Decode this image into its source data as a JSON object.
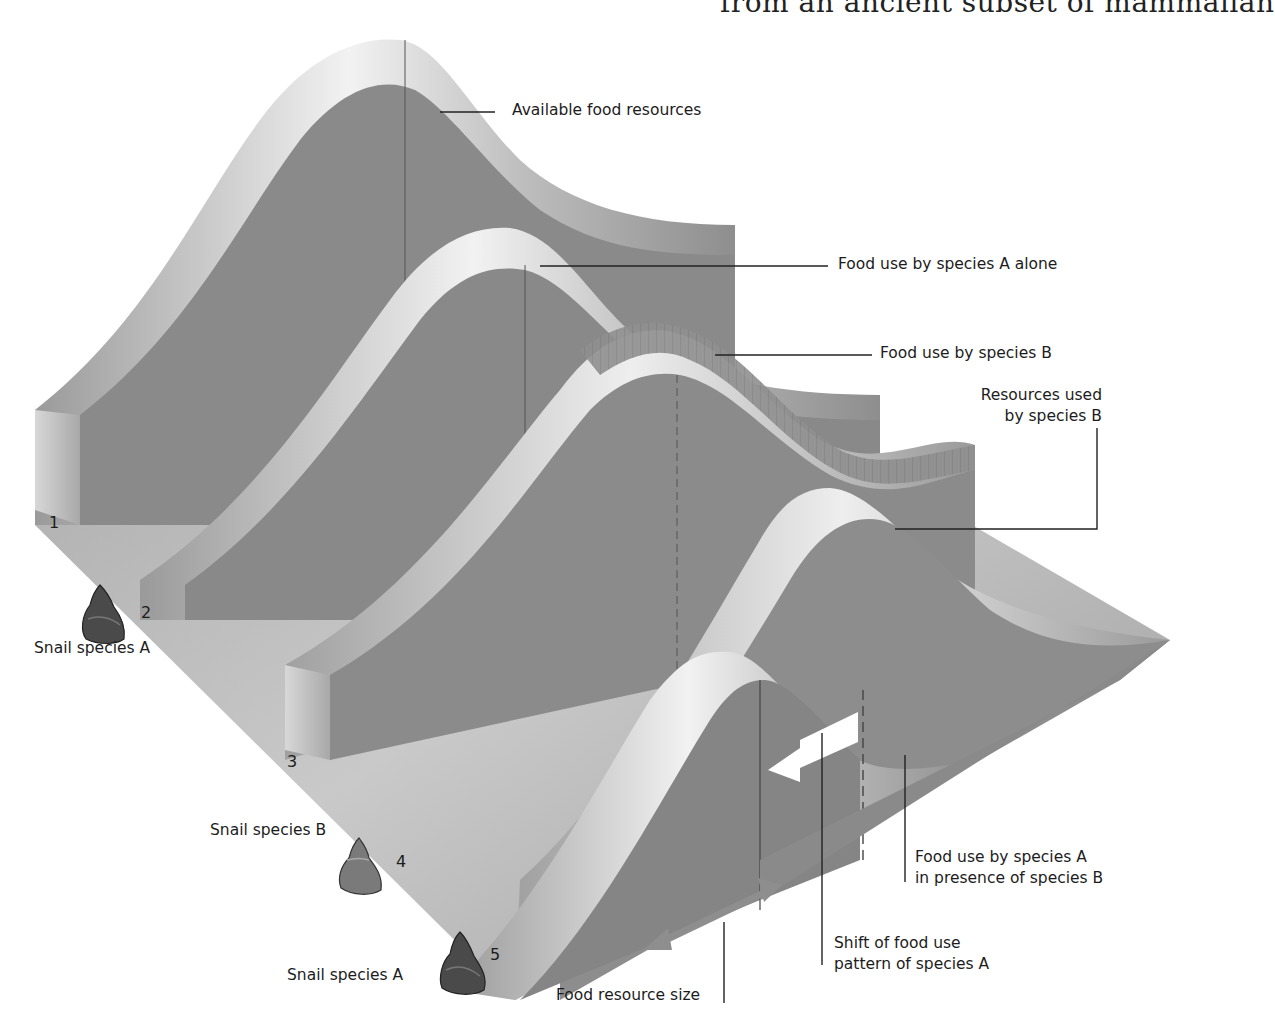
{
  "header": {
    "cropped_caption": "from an ancient subset of mammalian"
  },
  "diagram": {
    "axis": {
      "resource_axis_label": "Food resource size",
      "row_numbers": [
        "1",
        "2",
        "3",
        "4",
        "5"
      ]
    },
    "labels": {
      "available_food": "Available food resources",
      "species_a_alone": "Food use by species A alone",
      "species_b_use": "Food use by species B",
      "resources_b_line1": "Resources used",
      "resources_b_line2": "by species B",
      "species_a_presence_line1": "Food use by species A",
      "species_a_presence_line2": "in presence of species B",
      "shift_line1": "Shift of food use",
      "shift_line2": "pattern of species A"
    },
    "snails": [
      {
        "row": "2",
        "label": "Snail species A",
        "icon": "snail-shell-dark-icon"
      },
      {
        "row": "4",
        "label": "Snail species B",
        "icon": "snail-shell-light-icon"
      },
      {
        "row": "5",
        "label": "Snail species A",
        "icon": "snail-shell-dark-icon"
      }
    ],
    "icons": {
      "shift_arrow": "arrow-left-icon",
      "size_arrow": "double-arrow-icon"
    },
    "colors": {
      "surface": "#8c8c8c",
      "surface_dark": "#7e7e7e",
      "highlight": "#e8e8e8",
      "floor": "#9a9a9a",
      "text": "#1c1c1c",
      "snail_dark": "#4a4a4a",
      "snail_light": "#7a7a7a"
    }
  }
}
